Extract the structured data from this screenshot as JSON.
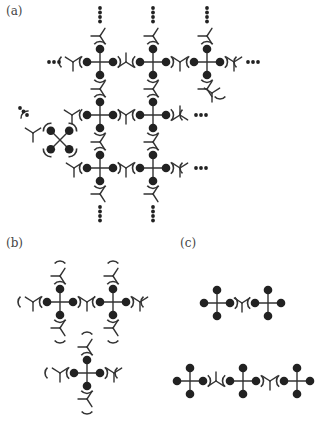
{
  "figure": {
    "panels": [
      {
        "id": "a",
        "label": "(a)",
        "x": 6,
        "y": 4,
        "description": "Extended 2D network of tetrahedral nodes linked by Y-shaped linkers; ellipsis dots indicate continuation"
      },
      {
        "id": "b",
        "label": "(b)",
        "x": 6,
        "y": 236,
        "description": "Trinuclear fragment: three tetrahedral nodes with Y-shaped linkers"
      },
      {
        "id": "c",
        "label": "(c)",
        "x": 180,
        "y": 236,
        "description": "Dimer and trimer chains of tetrahedral nodes joined by single Y-shaped linkers"
      }
    ],
    "colors": {
      "ink": "#222222",
      "line": "#333333",
      "background": "#ffffff"
    },
    "glyphs": {
      "node": "four-ball-cross",
      "linker": "Y-shaped",
      "continuation": "dotted-ellipsis"
    }
  }
}
